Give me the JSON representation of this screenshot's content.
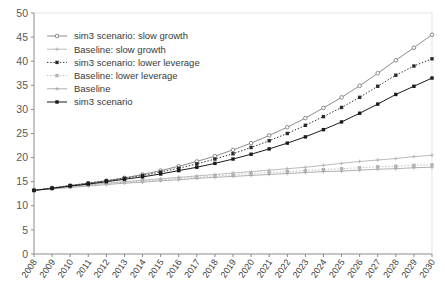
{
  "chart_data": {
    "type": "line",
    "title": "",
    "xlabel": "",
    "ylabel": "",
    "ylim": [
      0,
      50
    ],
    "ytick_step": 5,
    "yticks": [
      0,
      5,
      10,
      15,
      20,
      25,
      30,
      35,
      40,
      45,
      50
    ],
    "grid": false,
    "legend_position": "top-left",
    "x": [
      2008,
      2009,
      2010,
      2011,
      2012,
      2013,
      2014,
      2015,
      2016,
      2017,
      2018,
      2019,
      2020,
      2021,
      2022,
      2023,
      2024,
      2025,
      2026,
      2027,
      2028,
      2029,
      2030
    ],
    "categories": [
      "2008",
      "2009",
      "2010",
      "2011",
      "2012",
      "2013",
      "2014",
      "2015",
      "2016",
      "2017",
      "2018",
      "2019",
      "2020",
      "2021",
      "2022",
      "2023",
      "2024",
      "2025",
      "2026",
      "2027",
      "2028",
      "2029",
      "2030"
    ],
    "series": [
      {
        "name": "sim3 scenario: slow growth",
        "color": "#7f7f7f",
        "line_style": "solid",
        "marker": "open-circle",
        "values": [
          13.2,
          13.7,
          14.2,
          14.7,
          15.2,
          15.8,
          16.5,
          17.3,
          18.2,
          19.2,
          20.3,
          21.6,
          23.0,
          24.6,
          26.3,
          28.2,
          30.3,
          32.5,
          34.9,
          37.5,
          40.2,
          42.8,
          45.5
        ]
      },
      {
        "name": "Baseline: slow growth",
        "color": "#b3b3b3",
        "line_style": "solid",
        "marker": "small-plus",
        "values": [
          13.2,
          13.6,
          14.0,
          14.4,
          14.7,
          15.0,
          15.3,
          15.6,
          15.9,
          16.2,
          16.5,
          16.8,
          17.1,
          17.4,
          17.7,
          18.0,
          18.4,
          18.8,
          19.2,
          19.5,
          19.8,
          20.2,
          20.5
        ]
      },
      {
        "name": "sim3 scenario: lower leverage",
        "color": "#2b2b2b",
        "line_style": "dotted",
        "marker": "filled-square",
        "values": [
          13.2,
          13.7,
          14.2,
          14.7,
          15.2,
          15.7,
          16.3,
          17.0,
          17.8,
          18.7,
          19.7,
          20.8,
          22.1,
          23.5,
          25.0,
          26.7,
          28.5,
          30.4,
          32.5,
          34.8,
          37.1,
          39.0,
          40.5
        ]
      },
      {
        "name": "Baseline: lower leverage",
        "color": "#b3b3b3",
        "line_style": "dotted",
        "marker": "filled-square",
        "values": [
          13.2,
          13.6,
          13.9,
          14.3,
          14.6,
          14.9,
          15.2,
          15.4,
          15.7,
          15.9,
          16.2,
          16.4,
          16.7,
          16.9,
          17.1,
          17.3,
          17.5,
          17.7,
          17.9,
          18.1,
          18.2,
          18.4,
          18.5
        ]
      },
      {
        "name": "Baseline",
        "color": "#a6a6a6",
        "line_style": "solid",
        "marker": "small-plus",
        "values": [
          13.2,
          13.5,
          13.8,
          14.1,
          14.4,
          14.7,
          14.9,
          15.2,
          15.4,
          15.7,
          15.9,
          16.1,
          16.3,
          16.5,
          16.7,
          16.9,
          17.1,
          17.2,
          17.4,
          17.6,
          17.7,
          17.9,
          18.0
        ]
      },
      {
        "name": "sim3 scenario",
        "color": "#1a1a1a",
        "line_style": "solid",
        "marker": "filled-square",
        "values": [
          13.2,
          13.6,
          14.1,
          14.5,
          15.0,
          15.5,
          16.0,
          16.6,
          17.3,
          18.0,
          18.8,
          19.7,
          20.7,
          21.8,
          23.0,
          24.3,
          25.8,
          27.4,
          29.2,
          31.1,
          33.1,
          34.8,
          36.5
        ]
      }
    ]
  },
  "axis": {
    "y_labels": [
      "50",
      "45",
      "40",
      "35",
      "30",
      "25",
      "20",
      "15",
      "10",
      "5",
      "0"
    ],
    "x_labels": [
      "2008",
      "2009",
      "2010",
      "2011",
      "2012",
      "2013",
      "2014",
      "2015",
      "2016",
      "2017",
      "2018",
      "2019",
      "2020",
      "2021",
      "2022",
      "2023",
      "2024",
      "2025",
      "2026",
      "2027",
      "2028",
      "2029",
      "2030"
    ]
  },
  "legend": {
    "items": [
      {
        "label": "sim3 scenario: slow growth"
      },
      {
        "label": "Baseline: slow growth"
      },
      {
        "label": "sim3 scenario: lower leverage"
      },
      {
        "label": "Baseline: lower leverage"
      },
      {
        "label": "Baseline"
      },
      {
        "label": "sim3 scenario"
      }
    ]
  },
  "colors": {
    "axis": "#8c8c8c",
    "tick_label": "#595959",
    "background": "#ffffff"
  }
}
